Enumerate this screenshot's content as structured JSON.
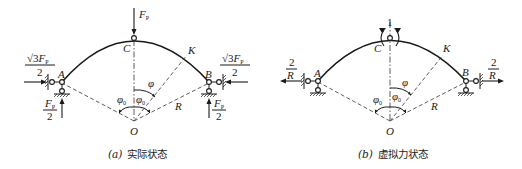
{
  "diagrams": [
    {
      "id": "a",
      "caption_label": "(a)",
      "caption_text": "实际状态",
      "points": {
        "A": "A",
        "B": "B",
        "C": "C",
        "K": "K",
        "O": "O"
      },
      "radius_label": "R",
      "angles": {
        "phi": "φ",
        "phi0_left": "φ",
        "phi0_right": "φ",
        "phi0_sub": "0"
      },
      "loads": {
        "top_force": {
          "symbol": "F",
          "sub": "P"
        },
        "left_horizontal": {
          "numerator_root": "√3",
          "numerator_symbol": "F",
          "numerator_sub": "P",
          "denominator": "2"
        },
        "left_vertical": {
          "numerator_symbol": "F",
          "numerator_sub": "P",
          "denominator": "2"
        },
        "right_horizontal": {
          "numerator_root": "√3",
          "numerator_symbol": "F",
          "numerator_sub": "P",
          "denominator": "2"
        },
        "right_vertical": {
          "numerator_symbol": "F",
          "numerator_sub": "P",
          "denominator": "2"
        }
      }
    },
    {
      "id": "b",
      "caption_label": "(b)",
      "caption_text": "虚拟力状态",
      "points": {
        "A": "A",
        "B": "B",
        "C": "C",
        "K": "K",
        "O": "O"
      },
      "radius_label": "R",
      "angles": {
        "phi": "φ",
        "phi0_left": "φ",
        "phi0_right": "φ",
        "phi0_sub": "0"
      },
      "loads": {
        "unit_moment": "1",
        "left_horizontal": {
          "numerator": "2",
          "denominator": "R"
        },
        "right_horizontal": {
          "numerator": "2",
          "denominator": "R"
        }
      }
    }
  ]
}
